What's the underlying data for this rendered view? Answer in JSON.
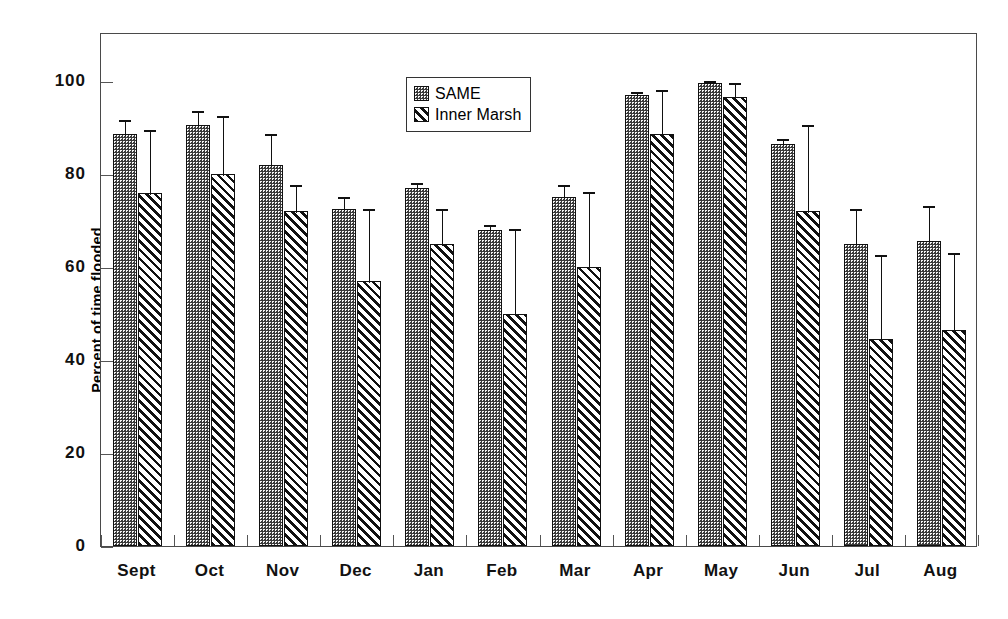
{
  "chart_data": {
    "type": "bar",
    "title": "",
    "subtitle": "",
    "xlabel": "",
    "ylabel": "Percent of time flooded",
    "ylim": [
      0,
      110
    ],
    "yticks": [
      0,
      20,
      40,
      60,
      80,
      100
    ],
    "ytick_labels": [
      "0",
      "20",
      "40",
      "60",
      "80",
      "100"
    ],
    "grid": false,
    "legend_position": "upper center",
    "categories": [
      "Sept",
      "Oct",
      "Nov",
      "Dec",
      "Jan",
      "Feb",
      "Mar",
      "Apr",
      "May",
      "Jun",
      "Jul",
      "Aug"
    ],
    "series": [
      {
        "name": "SAME",
        "pattern": "stipple-dots",
        "values": [
          88.5,
          90.5,
          82.0,
          72.5,
          77.0,
          68.0,
          75.0,
          97.0,
          99.5,
          86.5,
          65.0,
          65.5
        ],
        "error_upper": [
          3.5,
          3.5,
          7.0,
          3.0,
          1.5,
          1.5,
          3.0,
          1.0,
          1.0,
          1.5,
          8.0,
          8.0
        ],
        "error_lower": [
          3.5,
          3.5,
          7.0,
          3.0,
          1.5,
          1.5,
          3.0,
          1.0,
          1.0,
          1.5,
          8.0,
          8.0
        ]
      },
      {
        "name": "Inner Marsh",
        "pattern": "diagonal-hatch",
        "values": [
          76.0,
          80.0,
          72.0,
          57.0,
          65.0,
          50.0,
          60.0,
          88.5,
          96.5,
          72.0,
          44.5,
          46.5
        ],
        "error_upper": [
          14.0,
          13.0,
          6.0,
          16.0,
          8.0,
          18.5,
          16.5,
          10.0,
          3.5,
          19.0,
          18.5,
          17.0
        ],
        "error_lower": [
          14.0,
          13.0,
          6.0,
          16.0,
          8.0,
          18.5,
          16.5,
          10.0,
          3.5,
          19.0,
          18.5,
          17.0
        ]
      }
    ],
    "legend": [
      {
        "label": "SAME",
        "pattern": "stipple-dots"
      },
      {
        "label": "Inner Marsh",
        "pattern": "diagonal-hatch"
      }
    ],
    "colors": {
      "same_fill": "#3a3a3a",
      "inner_marsh_fill": "#ffffff",
      "outline": "#111111",
      "axis": "#4a4a4a",
      "background": "#ffffff"
    }
  }
}
